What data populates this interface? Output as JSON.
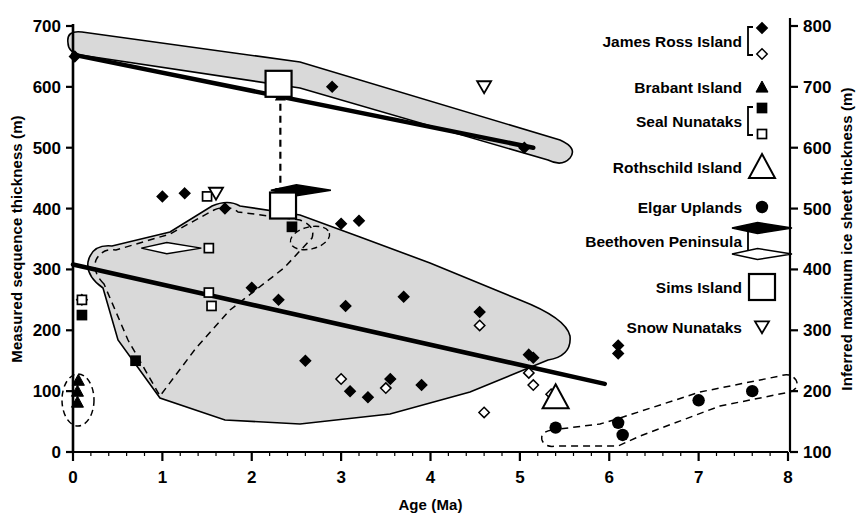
{
  "chart_data": {
    "type": "scatter",
    "title": "",
    "xlabel": "Age (Ma)",
    "ylabel": "Measured sequence thickness (m)",
    "ylabel_right": "Inferred maximum ice sheet thickness (m)",
    "xlim": [
      0,
      8
    ],
    "ylim": [
      0,
      700
    ],
    "ylim_right": [
      100,
      800
    ],
    "xticks": [
      "0",
      "1",
      "2",
      "3",
      "4",
      "5",
      "6",
      "7",
      "8"
    ],
    "yticks": [
      "0",
      "100",
      "200",
      "300",
      "400",
      "500",
      "600",
      "700"
    ],
    "yticks_right": [
      "100",
      "200",
      "300",
      "400",
      "500",
      "600",
      "700",
      "800"
    ],
    "grid": false,
    "legend_position": "top-right",
    "series": [
      {
        "name": "James Ross Island",
        "marker": "filled-diamond",
        "points": [
          [
            0.02,
            650
          ],
          [
            0.1,
            250
          ],
          [
            1.0,
            420
          ],
          [
            1.25,
            425
          ],
          [
            1.7,
            400
          ],
          [
            2.0,
            270
          ],
          [
            2.3,
            250
          ],
          [
            2.4,
            415
          ],
          [
            2.6,
            150
          ],
          [
            2.9,
            600
          ],
          [
            3.0,
            375
          ],
          [
            3.05,
            240
          ],
          [
            3.1,
            100
          ],
          [
            3.2,
            380
          ],
          [
            3.3,
            90
          ],
          [
            3.55,
            120
          ],
          [
            3.7,
            255
          ],
          [
            3.9,
            110
          ],
          [
            4.55,
            230
          ],
          [
            5.05,
            500
          ],
          [
            5.1,
            160
          ],
          [
            5.15,
            155
          ],
          [
            6.1,
            175
          ],
          [
            6.1,
            162
          ]
        ]
      },
      {
        "name": "James Ross Island",
        "marker": "open-diamond",
        "points": [
          [
            3.0,
            120
          ],
          [
            3.5,
            105
          ],
          [
            4.55,
            208
          ],
          [
            4.6,
            65
          ],
          [
            5.1,
            130
          ],
          [
            5.15,
            110
          ],
          [
            5.35,
            95
          ],
          [
            5.4,
            88
          ]
        ]
      },
      {
        "name": "Brabant Island",
        "marker": "filled-triangle",
        "points": [
          [
            0.06,
            118
          ],
          [
            0.05,
            100
          ],
          [
            0.05,
            82
          ]
        ]
      },
      {
        "name": "Seal Nunataks",
        "marker": "filled-square",
        "points": [
          [
            0.1,
            225
          ],
          [
            0.7,
            150
          ],
          [
            2.45,
            370
          ]
        ]
      },
      {
        "name": "Seal Nunataks",
        "marker": "open-square",
        "points": [
          [
            0.1,
            250
          ],
          [
            1.5,
            420
          ],
          [
            1.52,
            335
          ],
          [
            1.52,
            262
          ],
          [
            1.55,
            240
          ]
        ]
      },
      {
        "name": "Rothschild Island",
        "marker": "open-triangle",
        "points": [
          [
            5.4,
            90
          ]
        ]
      },
      {
        "name": "Elgar Uplands",
        "marker": "filled-circle",
        "points": [
          [
            5.4,
            40
          ],
          [
            6.1,
            48
          ],
          [
            6.15,
            28
          ],
          [
            7.0,
            85
          ],
          [
            7.6,
            100
          ]
        ]
      },
      {
        "name": "Beethoven Peninsula",
        "marker": "filled-lens",
        "points": [
          [
            2.55,
            430
          ]
        ]
      },
      {
        "name": "Beethoven Peninsula",
        "marker": "open-lens",
        "points": [
          [
            1.1,
            335
          ]
        ]
      },
      {
        "name": "Sims Island",
        "marker": "large-open-square",
        "points": [
          [
            2.3,
            605
          ],
          [
            2.35,
            405
          ]
        ]
      },
      {
        "name": "Snow Nunataks",
        "marker": "open-down-triangle",
        "points": [
          [
            1.6,
            425
          ],
          [
            4.6,
            600
          ]
        ]
      }
    ],
    "trend_lines": [
      {
        "name": "upper-band-trend",
        "from": [
          0.0,
          653
        ],
        "to": [
          5.15,
          500
        ]
      },
      {
        "name": "main-trend",
        "from": [
          0.0,
          308
        ],
        "to": [
          5.95,
          112
        ]
      }
    ],
    "annotations": [
      {
        "name": "sims-island-range-arrow",
        "type": "double-arrow",
        "from": [
          2.32,
          592
        ],
        "to": [
          2.32,
          420
        ]
      },
      {
        "name": "beethoven-filled-pointer",
        "x": 2.55,
        "y": 430
      },
      {
        "name": "beethoven-open-pointer",
        "x": 1.1,
        "y": 335
      }
    ]
  },
  "legend": {
    "items": [
      {
        "label": "James Ross Island",
        "markers": [
          "filled-diamond",
          "open-diamond"
        ],
        "bracket": true
      },
      {
        "label": "Brabant Island",
        "markers": [
          "filled-triangle"
        ],
        "bracket": false
      },
      {
        "label": "Seal Nunataks",
        "markers": [
          "filled-square",
          "open-square"
        ],
        "bracket": true
      },
      {
        "label": "Rothschild Island",
        "markers": [
          "open-triangle"
        ],
        "bracket": false
      },
      {
        "label": "Elgar Uplands",
        "markers": [
          "filled-circle"
        ],
        "bracket": false
      },
      {
        "label": "Beethoven Peninsula",
        "markers": [
          "filled-lens",
          "open-lens"
        ],
        "bracket": true
      },
      {
        "label": "Sims Island",
        "markers": [
          "large-open-square"
        ],
        "bracket": false
      },
      {
        "label": "Snow Nunataks",
        "markers": [
          "open-down-triangle"
        ],
        "bracket": false
      }
    ]
  },
  "colors": {
    "ink": "#000000",
    "envelope_fill": "#d9d9d9",
    "envelope_stroke": "#000000",
    "background": "#ffffff"
  }
}
